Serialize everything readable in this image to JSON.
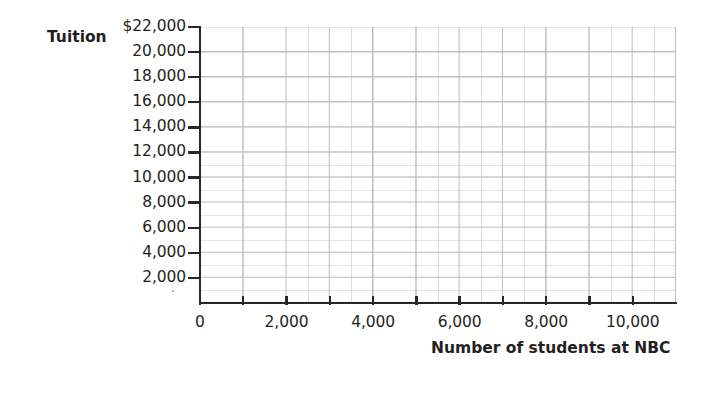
{
  "chart_data": {
    "type": "scatter",
    "title": "",
    "subtitle": "",
    "xlabel": "Number of students at NBC",
    "ylabel": "Tuition",
    "grid": true,
    "legend": null,
    "series": [],
    "x": [],
    "values": [],
    "note": "Blank coordinate grid - no data plotted",
    "xlim": [
      0,
      11000
    ],
    "ylim": [
      0,
      22000
    ],
    "x_ticks": [
      {
        "value": 0,
        "label": "0"
      },
      {
        "value": 2000,
        "label": "2,000"
      },
      {
        "value": 4000,
        "label": "4,000"
      },
      {
        "value": 6000,
        "label": "6,000"
      },
      {
        "value": 8000,
        "label": "8,000"
      },
      {
        "value": 10000,
        "label": "10,000"
      }
    ],
    "y_ticks": [
      {
        "value": 22000,
        "label": "$22,000"
      },
      {
        "value": 20000,
        "label": "20,000"
      },
      {
        "value": 18000,
        "label": "18,000"
      },
      {
        "value": 16000,
        "label": "16,000"
      },
      {
        "value": 14000,
        "label": "14,000"
      },
      {
        "value": 12000,
        "label": "12,000"
      },
      {
        "value": 10000,
        "label": "10,000"
      },
      {
        "value": 8000,
        "label": "8,000"
      },
      {
        "value": 6000,
        "label": "6,000"
      },
      {
        "value": 4000,
        "label": "4,000"
      },
      {
        "value": 2000,
        "label": "2,000"
      }
    ],
    "colors": {
      "background": "#ffffff",
      "axis": "#27262b",
      "grid_major": "#b9b9b9",
      "grid_minor": "#aaaaaa",
      "text": "#231f20"
    }
  }
}
